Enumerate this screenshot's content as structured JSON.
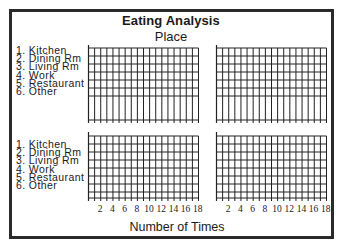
{
  "chart_data": {
    "type": "bar",
    "title": "Eating Analysis",
    "subtitle": "Place",
    "xlabel": "Number of Times",
    "ylabel": "",
    "orientation": "horizontal",
    "panels": 4,
    "layout": "2x2",
    "categories": [
      "1. Kitchen",
      "2. Dining Rm",
      "3. Living Rm",
      "4. Work",
      "5. Restaurant",
      "6. Other"
    ],
    "x_ticks": [
      2,
      4,
      6,
      8,
      10,
      12,
      14,
      16,
      18
    ],
    "xlim": [
      0,
      18
    ],
    "grid": true,
    "series": [],
    "note": "Blank worksheet grids - no data plotted"
  },
  "header": {
    "title": "Eating Analysis",
    "subtitle": "Place"
  },
  "legend_top": [
    "1. Kitchen",
    "2. Dining Rm",
    "3. Living Rm",
    "4. Work",
    "5. Restaurant",
    "6. Other"
  ],
  "legend_bottom": [
    "1. Kitchen",
    "2. Dining Rm",
    "3. Living Rm",
    "4. Work",
    "5. Restaurant",
    "6. Other"
  ],
  "ticks": [
    "2",
    "4",
    "6",
    "8",
    "10",
    "12",
    "14",
    "16",
    "18"
  ],
  "xlabel": "Number of Times"
}
